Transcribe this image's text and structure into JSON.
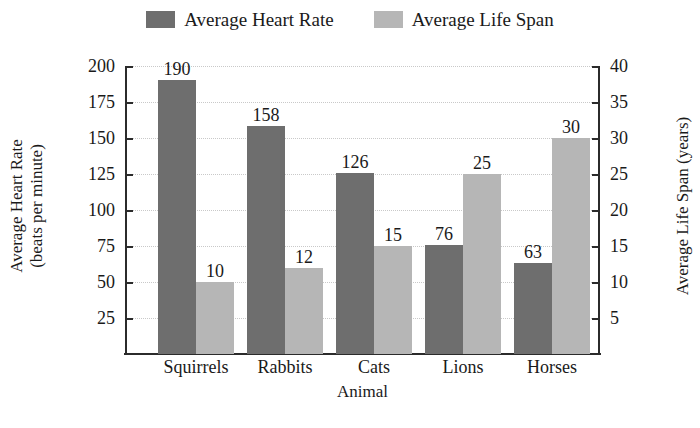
{
  "chart_data": {
    "type": "bar",
    "title": "",
    "categories": [
      "Squirrels",
      "Rabbits",
      "Cats",
      "Lions",
      "Horses"
    ],
    "series": [
      {
        "name": "Average Heart Rate",
        "axis": "left",
        "color": "#6e6e6e",
        "values": [
          190,
          158,
          126,
          76,
          63
        ]
      },
      {
        "name": "Average Life Span",
        "axis": "right",
        "color": "#b6b6b6",
        "values": [
          10,
          12,
          15,
          25,
          30
        ]
      }
    ],
    "xlabel": "Animal",
    "ylabel_left": "Average Heart Rate\n(beats per minute)",
    "ylabel_left_line1": "Average Heart Rate",
    "ylabel_left_line2": "(beats per minute)",
    "ylabel_right": "Average Life Span (years)",
    "ylim_left": [
      0,
      200
    ],
    "ylim_right": [
      0,
      40
    ],
    "yticks_left": [
      200,
      175,
      150,
      125,
      100,
      75,
      50,
      25
    ],
    "yticks_right": [
      40,
      35,
      30,
      25,
      20,
      15,
      10,
      5
    ],
    "grid": true,
    "legend_position": "top-center"
  },
  "legend": {
    "entries": [
      {
        "label": "Average Heart Rate",
        "color": "#6e6e6e"
      },
      {
        "label": "Average Life Span",
        "color": "#b6b6b6"
      }
    ]
  },
  "axes": {
    "left_title_line1": "Average Heart Rate",
    "left_title_line2": "(beats per minute)",
    "right_title": "Average Life Span (years)",
    "x_title": "Animal"
  },
  "ticks": {
    "left": [
      "200",
      "175",
      "150",
      "125",
      "100",
      "75",
      "50",
      "25"
    ],
    "right": [
      "40",
      "35",
      "30",
      "25",
      "20",
      "15",
      "10",
      "5"
    ]
  },
  "categories": [
    "Squirrels",
    "Rabbits",
    "Cats",
    "Lions",
    "Horses"
  ],
  "bar_values": {
    "heart_rate": [
      "190",
      "158",
      "126",
      "76",
      "63"
    ],
    "life_span": [
      "10",
      "12",
      "15",
      "25",
      "30"
    ]
  },
  "colors": {
    "heart_rate": "#6e6e6e",
    "life_span": "#b6b6b6",
    "axis": "#2b2b2b",
    "grid": "#c9c9c9",
    "background": "#ffffff"
  }
}
